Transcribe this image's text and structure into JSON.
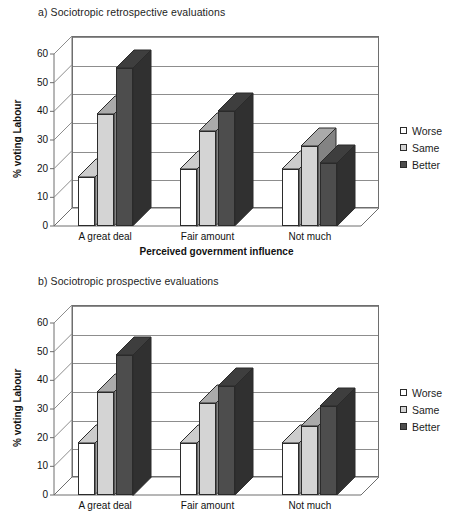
{
  "legend": {
    "items": [
      {
        "label": "Worse",
        "color": "#ffffff"
      },
      {
        "label": "Same",
        "color": "#d4d4d4"
      },
      {
        "label": "Better",
        "color": "#4d4d4d"
      }
    ]
  },
  "axis": {
    "ylabel": "% voting Labour",
    "xlabel": "Perceived government influence",
    "yticks": [
      "0",
      "10",
      "20",
      "30",
      "40",
      "50",
      "60"
    ],
    "categories": [
      "A great deal",
      "Fair amount",
      "Not much"
    ]
  },
  "chart_data": [
    {
      "type": "bar",
      "title": "a) Sociotropic retrospective evaluations",
      "categories": [
        "A great deal",
        "Fair amount",
        "Not much"
      ],
      "series": [
        {
          "name": "Worse",
          "values": [
            17,
            20,
            20
          ],
          "color": "#ffffff"
        },
        {
          "name": "Same",
          "values": [
            39,
            33,
            28
          ],
          "color": "#d4d4d4"
        },
        {
          "name": "Better",
          "values": [
            55,
            40,
            22
          ],
          "color": "#4d4d4d"
        }
      ],
      "xlabel": "Perceived government influence",
      "ylabel": "% voting Labour",
      "ylim": [
        0,
        60
      ],
      "ytick_step": 10,
      "grid": true,
      "legend_position": "right"
    },
    {
      "type": "bar",
      "title": "b) Sociotropic prospective evaluations",
      "categories": [
        "A great deal",
        "Fair amount",
        "Not much"
      ],
      "series": [
        {
          "name": "Worse",
          "values": [
            18,
            18,
            18
          ],
          "color": "#ffffff"
        },
        {
          "name": "Same",
          "values": [
            36,
            32,
            24
          ],
          "color": "#d4d4d4"
        },
        {
          "name": "Better",
          "values": [
            49,
            38,
            31
          ],
          "color": "#4d4d4d"
        }
      ],
      "xlabel": "Perceived government influence",
      "ylabel": "% voting Labour",
      "ylim": [
        0,
        60
      ],
      "ytick_step": 10,
      "grid": true,
      "legend_position": "right"
    }
  ]
}
